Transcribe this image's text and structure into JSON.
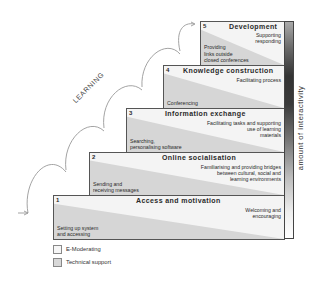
{
  "diagram": {
    "learning_label": "LEARNING",
    "interactivity_label": "amount of interactivity",
    "steps": [
      {
        "number": "1",
        "title": "Access and motivation",
        "e_moderating": "Welcoming and\nencouraging",
        "technical_support": "Setting up system\nand accessing"
      },
      {
        "number": "2",
        "title": "Online socialisation",
        "e_moderating": "Familiarising and providing bridges\nbetween cultural, social and\nlearning environments",
        "technical_support": "Sending and\nreceiving messages"
      },
      {
        "number": "3",
        "title": "Information exchange",
        "e_moderating": "Facilitating tasks and supporting\nuse of learning\nmaterials",
        "technical_support": "Searching,\npersonalising software"
      },
      {
        "number": "4",
        "title": "Knowledge construction",
        "e_moderating": "Facilitating process",
        "technical_support": "Conferencing"
      },
      {
        "number": "5",
        "title": "Development",
        "e_moderating": "Supporting\nresponding",
        "technical_support": "Providing\nlinks outside\nclosed conferences"
      }
    ],
    "legend": [
      {
        "label": "E-Moderating",
        "color": "#f6f6f6"
      },
      {
        "label": "Technical support",
        "color": "#d8d8d8"
      }
    ],
    "colors": {
      "e_moderating": "#f6f6f6",
      "technical_support": "#d6d6d6",
      "border": "#555555",
      "interactivity_dark": "#333333"
    }
  }
}
